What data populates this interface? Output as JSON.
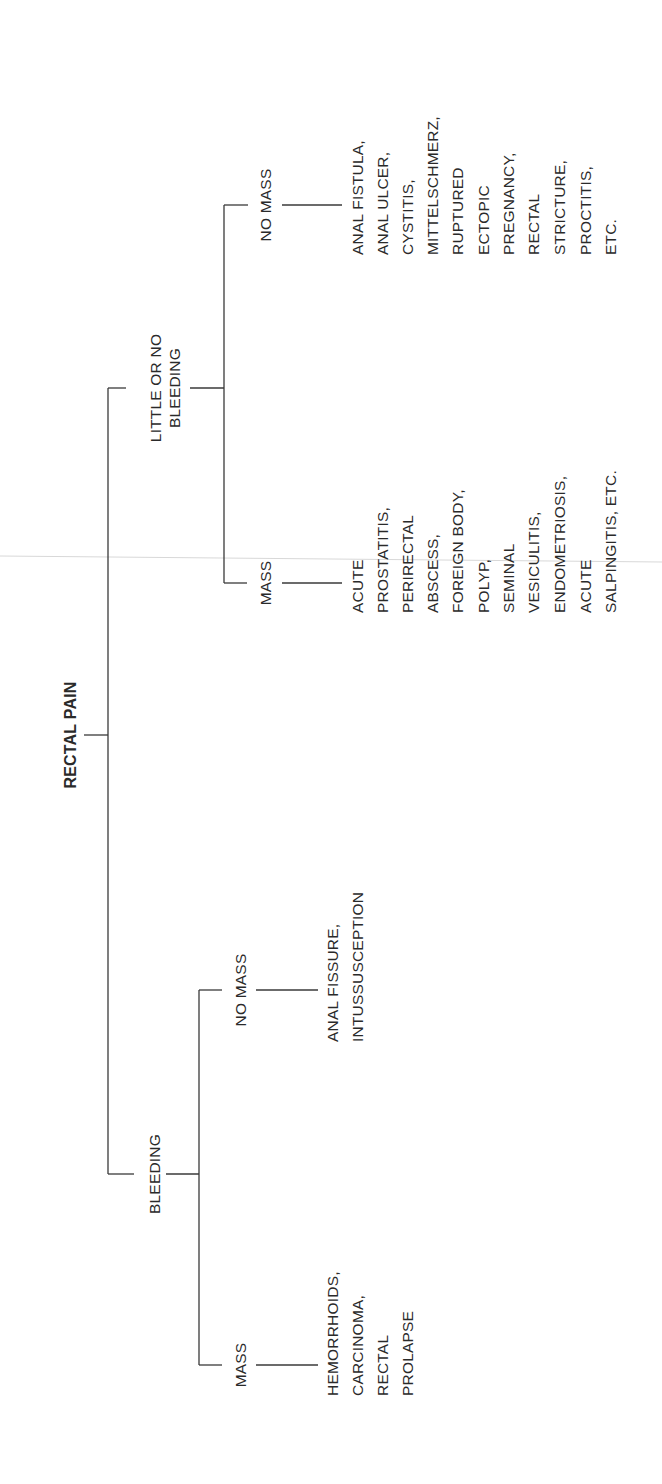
{
  "diagram": {
    "title": "RECTAL PAIN",
    "orientation": "rotated -90deg (text reads bottom-to-top)",
    "branches": [
      {
        "label": "BLEEDING",
        "children": [
          {
            "label": "MASS",
            "items": [
              "HEMORRHOIDS,",
              "CARCINOMA,",
              "RECTAL",
              "PROLAPSE"
            ]
          },
          {
            "label": "NO MASS",
            "items": [
              "ANAL FISSURE,",
              "INTUSSUSCEPTION"
            ]
          }
        ]
      },
      {
        "label_lines": [
          "LITTLE OR NO",
          "BLEEDING"
        ],
        "children": [
          {
            "label": "MASS",
            "items": [
              "ACUTE",
              "PROSTATITIS,",
              "PERIRECTAL",
              "ABSCESS,",
              "FOREIGN BODY,",
              "POLYP,",
              "SEMINAL",
              "VESICULITIS,",
              "ENDOMETRIOSIS,",
              "ACUTE",
              "SALPINGITIS, ETC."
            ]
          },
          {
            "label": "NO MASS",
            "items": [
              "ANAL FISTULA,",
              "ANAL ULCER,",
              "CYSTITIS,",
              "MITTELSCHMERZ,",
              "RUPTURED",
              "ECTOPIC",
              "PREGNANCY,",
              "RECTAL",
              "STRICTURE,",
              "PROCTITIS,",
              "ETC."
            ]
          }
        ]
      }
    ]
  }
}
